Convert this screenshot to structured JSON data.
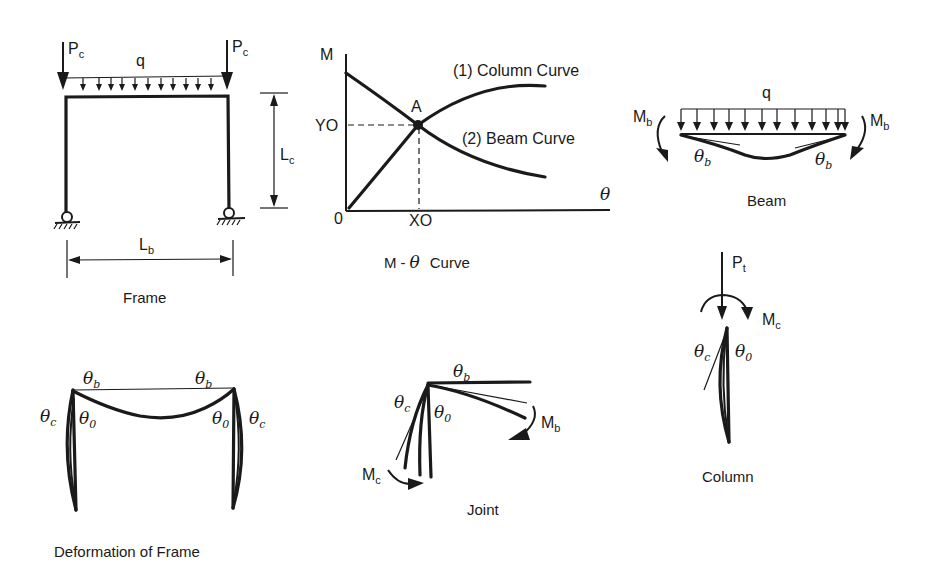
{
  "colors": {
    "ink": "#1a1a1a",
    "background": "#ffffff"
  },
  "frame": {
    "caption": "Frame",
    "load_left": {
      "main": "P",
      "sub": "c"
    },
    "load_right": {
      "main": "P",
      "sub": "c"
    },
    "distributed_load": "q",
    "column_length": {
      "main": "L",
      "sub": "c"
    },
    "beam_length": {
      "main": "L",
      "sub": "b"
    }
  },
  "m_theta": {
    "caption_m": "M",
    "caption_dash": "-",
    "caption_theta": "θ",
    "caption_curve": "Curve",
    "y_axis_label": "M",
    "x_axis_label": "θ",
    "origin_label": "0",
    "y_tick": "YO",
    "x_tick": "XO",
    "intersection_label": "A",
    "column_curve_label": "(1) Column Curve",
    "beam_curve_label": "(2) Beam Curve"
  },
  "beam": {
    "caption": "Beam",
    "distributed_load": "q",
    "moment_left": {
      "main": "M",
      "sub": "b"
    },
    "moment_right": {
      "main": "M",
      "sub": "b"
    },
    "rotation_left": {
      "main": "θ",
      "sub": "b"
    },
    "rotation_right": {
      "main": "θ",
      "sub": "b"
    }
  },
  "column": {
    "caption": "Column",
    "axial_load": {
      "main": "P",
      "sub": "t"
    },
    "moment": {
      "main": "M",
      "sub": "c"
    },
    "rotation_c": {
      "main": "θ",
      "sub": "c"
    },
    "rotation_0": {
      "main": "θ",
      "sub": "0"
    }
  },
  "deformation": {
    "caption": "Deformation of Frame",
    "theta_b_left": {
      "main": "θ",
      "sub": "b"
    },
    "theta_b_right": {
      "main": "θ",
      "sub": "b"
    },
    "theta_c_left": {
      "main": "θ",
      "sub": "c"
    },
    "theta_0_left": {
      "main": "θ",
      "sub": "0"
    },
    "theta_0_right": {
      "main": "θ",
      "sub": "0"
    },
    "theta_c_right": {
      "main": "θ",
      "sub": "c"
    }
  },
  "joint": {
    "caption": "Joint",
    "theta_b": {
      "main": "θ",
      "sub": "b"
    },
    "theta_c": {
      "main": "θ",
      "sub": "c"
    },
    "theta_0": {
      "main": "θ",
      "sub": "0"
    },
    "moment_b": {
      "main": "M",
      "sub": "b"
    },
    "moment_c": {
      "main": "M",
      "sub": "c"
    }
  }
}
